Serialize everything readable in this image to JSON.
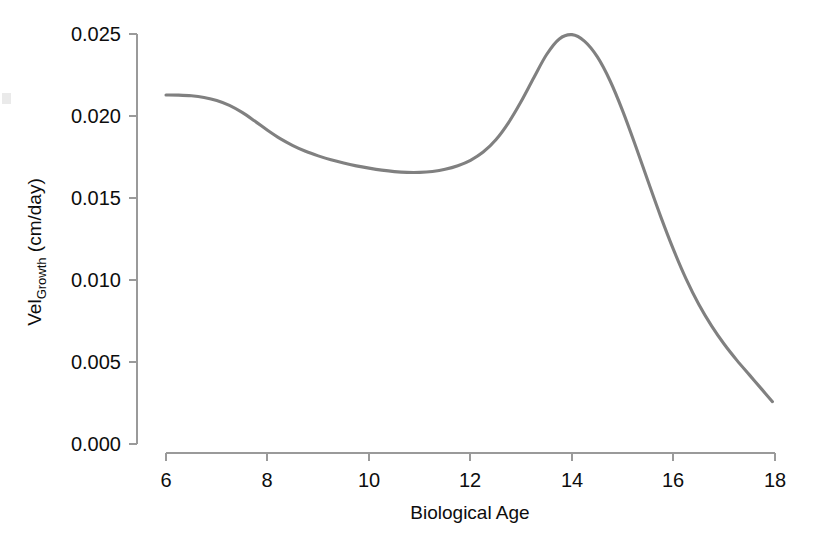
{
  "figure": {
    "background_color": "#ffffff",
    "plot_area": {
      "x0": 166,
      "x1": 775,
      "y0": 34,
      "y1": 444
    }
  },
  "chart_data": {
    "type": "line",
    "title": "",
    "subtitle": "",
    "xlabel": "Biological Age",
    "ylabel": "Vel",
    "ylabel_subscript": "Growth",
    "ylabel_units": "(cm/day)",
    "ylabel_full": "VelGrowth (cm/day)",
    "xlim": [
      6,
      18
    ],
    "ylim": [
      0.0,
      0.025
    ],
    "xticks": [
      6,
      8,
      10,
      12,
      14,
      16,
      18
    ],
    "xtick_labels": [
      "6",
      "8",
      "10",
      "12",
      "14",
      "16",
      "18"
    ],
    "yticks": [
      0.0,
      0.005,
      0.01,
      0.015,
      0.02,
      0.025
    ],
    "ytick_labels": [
      "0.000",
      "0.005",
      "0.010",
      "0.015",
      "0.020",
      "0.025"
    ],
    "grid": false,
    "legend": null,
    "legend_position": "none",
    "series": [
      {
        "name": "Growth velocity",
        "color": "#808080",
        "line_width": 3.1,
        "x": [
          6.0,
          6.25,
          6.5,
          6.75,
          7.0,
          7.25,
          7.5,
          7.75,
          8.0,
          8.25,
          8.5,
          8.75,
          9.0,
          9.25,
          9.5,
          9.75,
          10.0,
          10.25,
          10.5,
          10.75,
          11.0,
          11.25,
          11.5,
          11.75,
          12.0,
          12.25,
          12.5,
          12.75,
          13.0,
          13.25,
          13.5,
          13.75,
          14.0,
          14.25,
          14.5,
          14.75,
          15.0,
          15.25,
          15.5,
          15.75,
          16.0,
          16.25,
          16.5,
          16.75,
          17.0,
          17.25,
          17.5,
          17.75,
          17.95
        ],
        "y": [
          0.02128,
          0.02127,
          0.02123,
          0.02113,
          0.02095,
          0.02065,
          0.02022,
          0.01969,
          0.01913,
          0.01862,
          0.0182,
          0.01785,
          0.01757,
          0.01733,
          0.01713,
          0.01696,
          0.01682,
          0.0167,
          0.01661,
          0.01656,
          0.01656,
          0.01662,
          0.01675,
          0.01697,
          0.0173,
          0.0178,
          0.01855,
          0.0196,
          0.0209,
          0.02235,
          0.02375,
          0.0247,
          0.02496,
          0.02455,
          0.0236,
          0.02215,
          0.0203,
          0.0182,
          0.016,
          0.01385,
          0.01185,
          0.01005,
          0.0085,
          0.0072,
          0.00608,
          0.0051,
          0.0042,
          0.0033,
          0.00258
        ]
      }
    ],
    "annotations": [],
    "key_points": {
      "start": {
        "x": 6.0,
        "y": 0.0213
      },
      "local_minimum": {
        "x": 10.75,
        "y": 0.0156
      },
      "peak": {
        "x": 13.85,
        "y": 0.0249
      },
      "end": {
        "x": 17.95,
        "y": 0.0018
      }
    }
  }
}
